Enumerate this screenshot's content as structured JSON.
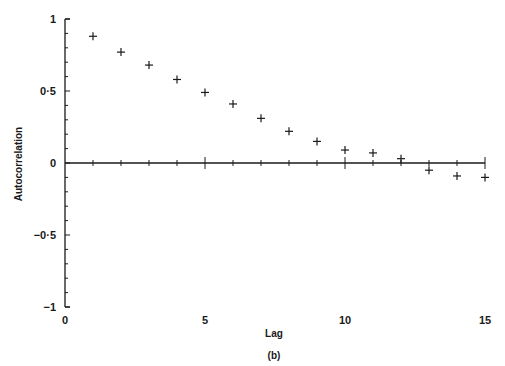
{
  "chart_data": {
    "type": "scatter",
    "title": "",
    "subtitle": "(b)",
    "xlabel": "Lag",
    "ylabel": "Autocorrelation",
    "xlim": [
      0,
      15
    ],
    "ylim": [
      -1,
      1
    ],
    "x_ticks": [
      0,
      5,
      10,
      15
    ],
    "x_tick_labels": [
      "0",
      "5",
      "10",
      "15"
    ],
    "y_ticks": [
      1,
      0.5,
      0,
      -0.5,
      -1
    ],
    "y_tick_labels": [
      "1",
      "0·5",
      "0",
      "−0·5",
      "−1"
    ],
    "grid": false,
    "marker": "+",
    "zero_line": true,
    "series": [
      {
        "name": "Autocorrelation",
        "x": [
          1,
          2,
          3,
          4,
          5,
          6,
          7,
          8,
          9,
          10,
          11,
          12,
          13,
          14,
          15
        ],
        "values": [
          0.88,
          0.77,
          0.68,
          0.58,
          0.49,
          0.41,
          0.31,
          0.22,
          0.15,
          0.09,
          0.07,
          0.03,
          -0.05,
          -0.09,
          -0.1
        ]
      }
    ]
  }
}
